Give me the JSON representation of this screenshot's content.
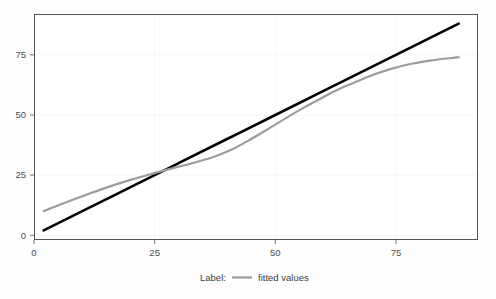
{
  "chart_data": {
    "type": "line",
    "title": "",
    "subtitle": "",
    "xlabel": "",
    "ylabel": "",
    "xlim": [
      0,
      92
    ],
    "ylim": [
      -2,
      92
    ],
    "x_ticks": [
      0,
      25,
      50,
      75
    ],
    "x_tick_labels": [
      "0",
      "25",
      "50",
      "75"
    ],
    "y_ticks": [
      0,
      25,
      50,
      75
    ],
    "y_tick_labels": [
      "0",
      "25",
      "50",
      "75"
    ],
    "grid": true,
    "legend_position": "bottom",
    "series": [
      {
        "name": "identity-line",
        "color": "#000000",
        "style": "solid",
        "in_legend": false,
        "x": [
          2,
          10,
          20,
          30,
          40,
          50,
          60,
          70,
          80,
          88
        ],
        "values": [
          2,
          10,
          20,
          30,
          40,
          50,
          60,
          70,
          80,
          88
        ]
      },
      {
        "name": "fitted values",
        "color": "#9c9c9c",
        "style": "solid",
        "in_legend": true,
        "x": [
          2,
          6,
          10,
          15,
          20,
          25,
          29,
          33,
          37,
          41,
          45,
          50,
          55,
          60,
          64,
          67,
          70,
          74,
          78,
          82,
          86,
          88
        ],
        "values": [
          10.0,
          13.2,
          16.2,
          19.8,
          23.0,
          25.8,
          28.0,
          30.0,
          32.4,
          35.6,
          40.0,
          46.0,
          52.0,
          57.5,
          61.5,
          64.0,
          66.5,
          69.2,
          71.2,
          72.6,
          73.6,
          74.0
        ]
      }
    ]
  },
  "legend": {
    "title": "Label:",
    "entries": [
      {
        "label": "fitted values",
        "color": "#9c9c9c"
      }
    ]
  },
  "colors": {
    "panel_border": "#555555",
    "gridline": "#f2f2f2",
    "axis_text": "#4d4d4d",
    "black_series": "#000000",
    "gray_series": "#9c9c9c",
    "background": "#fdfdfd"
  }
}
